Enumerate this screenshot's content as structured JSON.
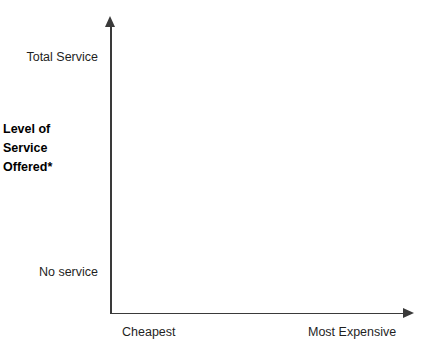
{
  "chart_data": {
    "type": "scatter",
    "title": "",
    "subtitle": "",
    "xlabel": "",
    "ylabel": "Level of\nService\nOffered*",
    "x_tick_labels": [
      "Cheapest",
      "Most Expensive"
    ],
    "y_tick_labels": [
      "No service",
      "Total Service"
    ],
    "x": [],
    "values": [],
    "series": [],
    "annotations": [],
    "legend": [],
    "legend_position": "none",
    "grid": false,
    "axis_style": "arrow-headed open axes, no box, no ticks, no data plotted"
  },
  "axes": {
    "y_title": "Level of\nService\nOffered*",
    "y_top_label": "Total Service",
    "y_bottom_label": "No service",
    "x_left_label": "Cheapest",
    "x_right_label": "Most Expensive"
  },
  "colors": {
    "background": "#ffffff",
    "axis": "#3a3a3a",
    "label_text": "#1f1f1f",
    "title_text": "#000000"
  }
}
